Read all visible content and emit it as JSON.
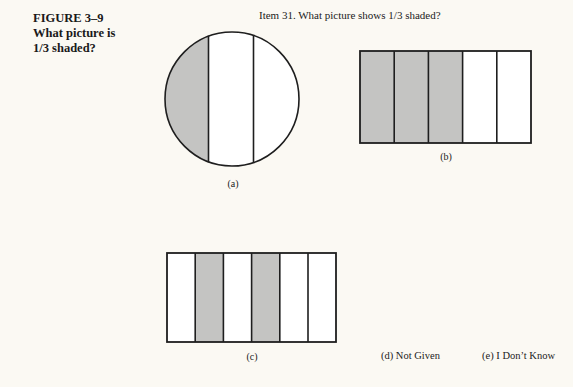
{
  "figure": {
    "number_label": "FIGURE 3–9",
    "caption_line1": "What picture is",
    "caption_line2": "1/3 shaded?"
  },
  "item": {
    "title": "Item 31. What picture shows 1/3 shaded?"
  },
  "options": {
    "a": {
      "label": "(a)",
      "shape": "circle",
      "parts": 3,
      "shaded_parts": [
        0
      ],
      "note": "circle cut by two vertical lines into unequal parts; leftmost part shaded"
    },
    "b": {
      "label": "(b)",
      "shape": "rectangle",
      "parts": 5,
      "shaded_parts": [
        0,
        1,
        2
      ]
    },
    "c": {
      "label": "(c)",
      "shape": "rectangle",
      "parts": 6,
      "shaded_parts": [
        1,
        3
      ]
    },
    "d": {
      "label": "(d) Not Given"
    },
    "e": {
      "label": "(e) I Don’t Know"
    }
  },
  "colors": {
    "background": "#fbf9f3",
    "shade": "#c4c4c2",
    "stroke": "#1e1e1e",
    "unshaded": "#ffffff"
  }
}
